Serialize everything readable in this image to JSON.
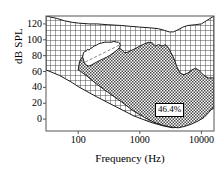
{
  "chart_data": {
    "type": "area",
    "title": "",
    "xlabel": "Frequency (Hz)",
    "ylabel": "dB SPL",
    "xscale": "log",
    "xlim": [
      30,
      16000
    ],
    "ylim": [
      -15,
      130
    ],
    "xticks": [
      100,
      1000,
      10000
    ],
    "xtick_labels": [
      "100",
      "1000",
      "10000"
    ],
    "yticks": [
      0,
      20,
      40,
      60,
      80,
      100,
      120
    ],
    "ytick_labels": [
      "0",
      "20",
      "40",
      "60",
      "80",
      "100",
      "120"
    ],
    "grid": false,
    "legend": false,
    "annotations": [
      {
        "text": "46.4%",
        "x": 5000,
        "y": 22,
        "boxed": true
      }
    ],
    "series": [
      {
        "name": "auditory-field-hatched",
        "fill": "cross-hatch",
        "description": "Full auditory area bounded above by threshold-of-discomfort contour and below by hearing threshold line",
        "upper_contour": [
          [
            30,
            130
          ],
          [
            45,
            127
          ],
          [
            60,
            124
          ],
          [
            80,
            122
          ],
          [
            100,
            121
          ],
          [
            150,
            120
          ],
          [
            200,
            120
          ],
          [
            300,
            119
          ],
          [
            500,
            118
          ],
          [
            700,
            117
          ],
          [
            1000,
            116
          ],
          [
            1500,
            115
          ],
          [
            2000,
            114
          ],
          [
            2500,
            112
          ],
          [
            3000,
            110
          ],
          [
            3500,
            110
          ],
          [
            4000,
            112
          ],
          [
            5000,
            116
          ],
          [
            6000,
            118
          ],
          [
            8000,
            119
          ],
          [
            10000,
            120
          ],
          [
            12000,
            124
          ],
          [
            16000,
            130
          ]
        ],
        "lower_contour": [
          [
            30,
            62
          ],
          [
            50,
            55
          ],
          [
            80,
            46
          ],
          [
            100,
            41
          ],
          [
            200,
            28
          ],
          [
            400,
            16
          ],
          [
            800,
            4
          ],
          [
            1500,
            -4
          ],
          [
            2500,
            -9
          ],
          [
            3500,
            -11
          ],
          [
            5000,
            -8
          ],
          [
            8000,
            0
          ],
          [
            12000,
            8
          ],
          [
            16000,
            14
          ]
        ]
      },
      {
        "name": "aided-audible-area",
        "fill": "checkerboard-gray",
        "fill_color": "#8a8a8a",
        "percent_of_field": 46.4,
        "description": "Shaded region representing the portion of the auditory field that is audible",
        "outline": [
          [
            100,
            62
          ],
          [
            105,
            72
          ],
          [
            115,
            78
          ],
          [
            130,
            80
          ],
          [
            150,
            82
          ],
          [
            180,
            86
          ],
          [
            220,
            88
          ],
          [
            260,
            90
          ],
          [
            300,
            91
          ],
          [
            350,
            92
          ],
          [
            420,
            90
          ],
          [
            500,
            88
          ],
          [
            560,
            84
          ],
          [
            620,
            84
          ],
          [
            700,
            86
          ],
          [
            800,
            88
          ],
          [
            900,
            90
          ],
          [
            1000,
            92
          ],
          [
            1200,
            95
          ],
          [
            1400,
            97
          ],
          [
            1600,
            96
          ],
          [
            1800,
            92
          ],
          [
            2000,
            94
          ],
          [
            2300,
            92
          ],
          [
            2600,
            94
          ],
          [
            2900,
            90
          ],
          [
            3200,
            84
          ],
          [
            3600,
            76
          ],
          [
            4000,
            66
          ],
          [
            4500,
            58
          ],
          [
            5200,
            56
          ],
          [
            6000,
            58
          ],
          [
            7000,
            62
          ],
          [
            8000,
            64
          ],
          [
            9000,
            62
          ],
          [
            10000,
            58
          ],
          [
            11500,
            54
          ],
          [
            13000,
            52
          ],
          [
            16000,
            52
          ],
          [
            16000,
            16
          ],
          [
            13000,
            8
          ],
          [
            11000,
            2
          ],
          [
            9000,
            -2
          ],
          [
            7000,
            -6
          ],
          [
            5500,
            -9
          ],
          [
            4200,
            -11
          ],
          [
            3200,
            -10
          ],
          [
            2400,
            -8
          ],
          [
            1700,
            -4
          ],
          [
            1200,
            2
          ],
          [
            800,
            10
          ],
          [
            500,
            22
          ],
          [
            300,
            34
          ],
          [
            200,
            44
          ],
          [
            140,
            54
          ],
          [
            110,
            60
          ],
          [
            100,
            62
          ]
        ]
      },
      {
        "name": "unaided-lobe",
        "fill": "white",
        "description": "White inner lobe cut out of the hatched field, with dashed reference line through its long axis",
        "outline": [
          [
            118,
            78
          ],
          [
            122,
            84
          ],
          [
            128,
            85
          ],
          [
            136,
            86
          ],
          [
            142,
            88
          ],
          [
            150,
            87
          ],
          [
            158,
            89
          ],
          [
            168,
            90
          ],
          [
            180,
            92
          ],
          [
            196,
            93
          ],
          [
            215,
            95
          ],
          [
            240,
            96
          ],
          [
            270,
            97
          ],
          [
            300,
            97
          ],
          [
            340,
            97
          ],
          [
            380,
            98
          ],
          [
            420,
            97
          ],
          [
            450,
            97
          ],
          [
            470,
            96
          ],
          [
            480,
            93
          ],
          [
            465,
            90
          ],
          [
            440,
            88
          ],
          [
            410,
            86
          ],
          [
            380,
            84
          ],
          [
            350,
            82
          ],
          [
            320,
            80
          ],
          [
            290,
            78
          ],
          [
            255,
            76
          ],
          [
            225,
            74
          ],
          [
            200,
            72
          ],
          [
            180,
            70
          ],
          [
            162,
            68
          ],
          [
            148,
            67
          ],
          [
            136,
            68
          ],
          [
            126,
            71
          ],
          [
            118,
            78
          ]
        ],
        "dashed_line": [
          [
            130,
            72
          ],
          [
            460,
            93
          ]
        ]
      }
    ]
  }
}
